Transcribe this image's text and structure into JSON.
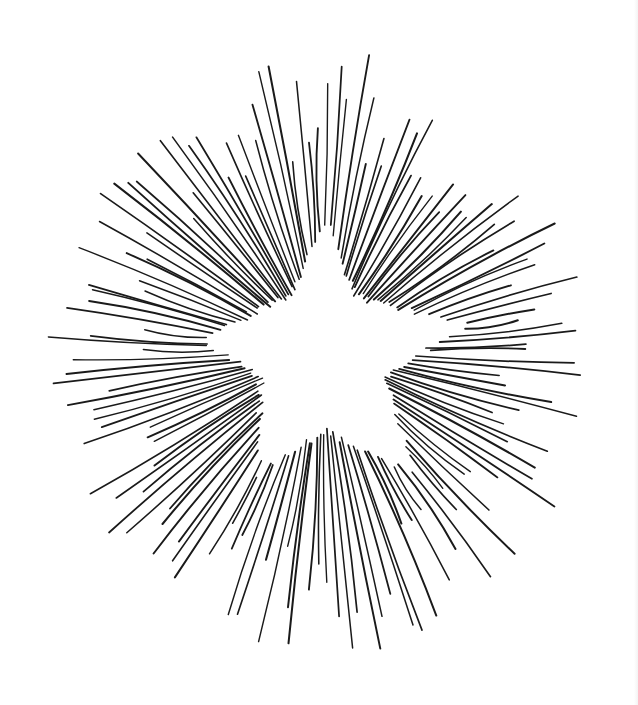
{
  "artwork": {
    "subject": "star-burst",
    "colors": {
      "background": "#ffffff",
      "ink": "#1a1a1a",
      "star_fill": "#ffffff"
    },
    "center": [
      322,
      352
    ],
    "star_points": [
      [
        327,
        228
      ],
      [
        352,
        302
      ],
      [
        462,
        326
      ],
      [
        379,
        374
      ],
      [
        412,
        470
      ],
      [
        325,
        424
      ],
      [
        262,
        468
      ],
      [
        266,
        374
      ],
      [
        206,
        340
      ],
      [
        292,
        302
      ]
    ],
    "ray_count": 150,
    "ray_stroke_width": 1.7,
    "outer_extent": {
      "left": 40,
      "right": 597,
      "top": 47,
      "bottom": 655
    }
  }
}
